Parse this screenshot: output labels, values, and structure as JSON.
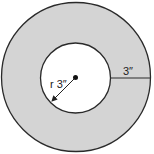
{
  "diagram": {
    "type": "annulus",
    "outer_circle": {
      "cx": 76,
      "cy": 77,
      "r": 74.5
    },
    "inner_circle": {
      "cx": 75.5,
      "cy": 78,
      "r": 35
    },
    "center_dot": {
      "cx": 75.5,
      "cy": 77.5,
      "r": 2.5
    },
    "colors": {
      "ring_fill": "#d4d4d4",
      "inner_fill": "#ffffff",
      "stroke": "#2a2a2a"
    },
    "labels": {
      "radius": "r 3″",
      "ring_width": "3″"
    }
  }
}
